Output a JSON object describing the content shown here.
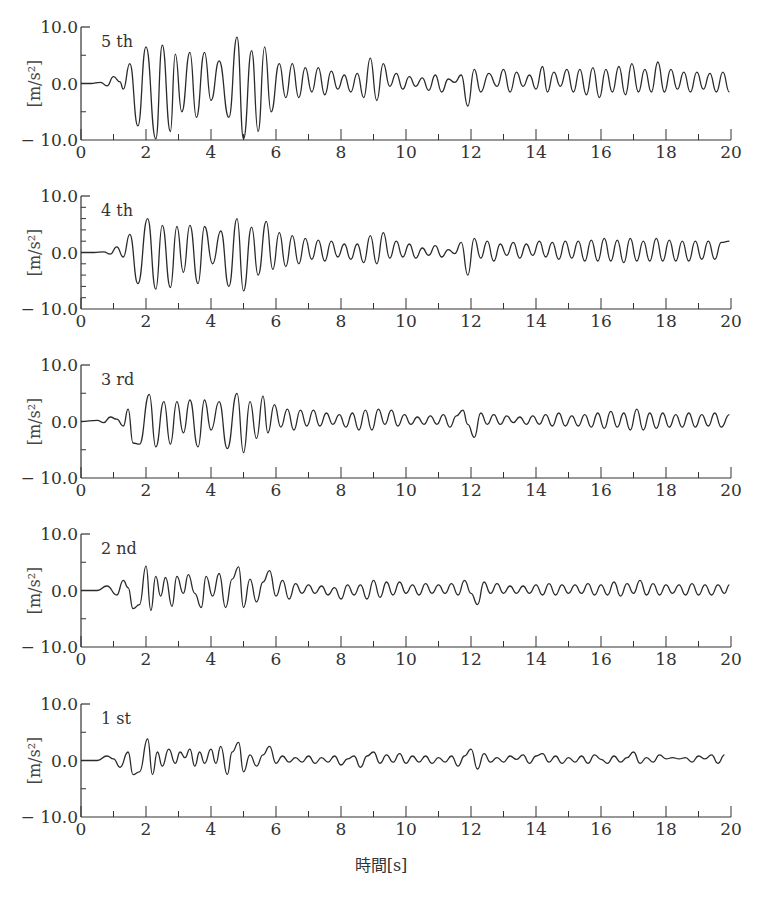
{
  "chart_data": {
    "type": "line",
    "title": "",
    "xlabel": "時間[s]",
    "ylabel": "[m/s²]",
    "xlim": [
      0,
      20
    ],
    "ylim": [
      -10,
      10
    ],
    "x_ticks": [
      0,
      2,
      4,
      6,
      8,
      10,
      12,
      14,
      16,
      18,
      20
    ],
    "x_minor_step": 1,
    "y_tick_labels": [
      "10.0",
      "0.0",
      "-10.0"
    ],
    "grid": false,
    "legend": "none",
    "panels": [
      {
        "label": "5 th",
        "y_minor_step": 5,
        "series": {
          "name": "5 th",
          "x": [
            0,
            0.3,
            0.6,
            0.8,
            1.0,
            1.2,
            1.3,
            1.5,
            1.75,
            2.0,
            2.3,
            2.5,
            2.75,
            2.9,
            3.1,
            3.35,
            3.55,
            3.8,
            4.0,
            4.25,
            4.55,
            4.8,
            5.0,
            5.25,
            5.45,
            5.65,
            5.85,
            6.1,
            6.3,
            6.5,
            6.7,
            6.9,
            7.1,
            7.3,
            7.5,
            7.7,
            7.9,
            8.1,
            8.3,
            8.5,
            8.7,
            8.9,
            9.1,
            9.3,
            9.5,
            9.7,
            9.9,
            10.1,
            10.3,
            10.5,
            10.7,
            10.9,
            11.1,
            11.3,
            11.5,
            11.7,
            11.9,
            12.1,
            12.3,
            12.55,
            12.8,
            13.0,
            13.2,
            13.4,
            13.6,
            13.8,
            14.0,
            14.2,
            14.35,
            14.55,
            14.75,
            14.95,
            15.15,
            15.35,
            15.55,
            15.75,
            15.95,
            16.15,
            16.35,
            16.55,
            16.75,
            16.95,
            17.15,
            17.35,
            17.55,
            17.75,
            17.95,
            18.15,
            18.35,
            18.55,
            18.75,
            18.95,
            19.15,
            19.35,
            19.55,
            19.75,
            19.95
          ],
          "y": [
            0,
            0,
            0.2,
            -0.4,
            1.2,
            0.3,
            -1.0,
            3.5,
            -7.5,
            6.5,
            -9.8,
            6.8,
            -8.5,
            5.2,
            -5.0,
            5.5,
            -6.0,
            5.5,
            -3.0,
            4.0,
            -6.0,
            8.2,
            -9.8,
            5.8,
            -8.5,
            6.5,
            -5.0,
            3.5,
            -2.5,
            3.5,
            -2.5,
            2.8,
            -1.5,
            2.8,
            -2.0,
            2.2,
            -1.0,
            1.5,
            -1.5,
            1.8,
            -2.5,
            4.5,
            -3.0,
            3.5,
            -0.5,
            1.8,
            -1.0,
            1.2,
            -0.5,
            1.0,
            -1.2,
            1.5,
            -1.5,
            0.8,
            0.2,
            1.5,
            -4.0,
            2.5,
            -1.5,
            1.8,
            -0.5,
            2.5,
            -1.5,
            2.0,
            -0.5,
            1.5,
            -1.0,
            3.0,
            -1.5,
            2.0,
            -0.5,
            2.5,
            -1.5,
            2.5,
            -2.0,
            2.8,
            -2.5,
            2.5,
            -1.5,
            3.0,
            -2.0,
            3.5,
            -1.5,
            2.5,
            -1.5,
            3.8,
            -1.5,
            2.5,
            -1.0,
            2.0,
            -1.5,
            2.0,
            -1.0,
            1.8,
            -1.5,
            2.0,
            -1.5,
            2.2
          ]
        }
      },
      {
        "label": "4 th",
        "y_minor_step": 2,
        "series": {
          "name": "4 th",
          "x": [
            0,
            0.4,
            0.7,
            0.9,
            1.1,
            1.3,
            1.5,
            1.75,
            2.05,
            2.3,
            2.5,
            2.75,
            2.95,
            3.15,
            3.35,
            3.6,
            3.8,
            4.05,
            4.3,
            4.55,
            4.8,
            5.0,
            5.25,
            5.45,
            5.7,
            5.9,
            6.1,
            6.3,
            6.5,
            6.7,
            6.9,
            7.1,
            7.3,
            7.5,
            7.7,
            7.9,
            8.1,
            8.3,
            8.5,
            8.7,
            8.9,
            9.1,
            9.3,
            9.5,
            9.7,
            9.9,
            10.1,
            10.3,
            10.5,
            10.7,
            10.9,
            11.1,
            11.3,
            11.5,
            11.7,
            11.9,
            12.1,
            12.3,
            12.5,
            12.7,
            12.9,
            13.1,
            13.3,
            13.5,
            13.7,
            13.9,
            14.1,
            14.3,
            14.5,
            14.7,
            14.9,
            15.1,
            15.3,
            15.5,
            15.7,
            15.9,
            16.1,
            16.3,
            16.5,
            16.7,
            16.9,
            17.1,
            17.3,
            17.5,
            17.7,
            17.9,
            18.1,
            18.3,
            18.5,
            18.7,
            18.9,
            19.1,
            19.3,
            19.5,
            19.7,
            19.95
          ],
          "y": [
            0,
            0,
            0.1,
            -0.3,
            1.0,
            -0.8,
            3.2,
            -5.5,
            6.0,
            -6.5,
            4.8,
            -6.2,
            4.6,
            -3.5,
            4.8,
            -5.5,
            4.6,
            -2.0,
            3.8,
            -6.0,
            6.0,
            -6.8,
            4.5,
            -4.0,
            5.5,
            -3.0,
            3.5,
            -2.5,
            3.0,
            -2.0,
            2.5,
            -1.2,
            2.2,
            -1.5,
            2.0,
            -0.8,
            1.5,
            -1.2,
            1.5,
            -1.8,
            3.0,
            -2.0,
            3.5,
            -1.0,
            2.0,
            -0.8,
            1.5,
            -1.0,
            0.8,
            -0.5,
            1.2,
            -0.8,
            0.5,
            -0.2,
            1.8,
            -4.0,
            2.5,
            -1.0,
            2.0,
            -1.5,
            1.5,
            -0.5,
            1.8,
            -1.0,
            1.5,
            -0.5,
            2.0,
            -0.8,
            1.8,
            -1.2,
            2.0,
            -1.0,
            2.0,
            -1.5,
            2.2,
            -1.5,
            2.5,
            -1.5,
            2.2,
            -1.8,
            2.5,
            -1.5,
            2.0,
            -1.5,
            2.5,
            -1.5,
            2.2,
            -1.5,
            2.0,
            -1.5,
            2.0,
            -1.2,
            2.0,
            -1.2,
            1.8,
            2.0
          ]
        }
      },
      {
        "label": "3 rd",
        "y_minor_step": 5,
        "series": {
          "name": "3 rd",
          "x": [
            0,
            0.5,
            0.7,
            0.9,
            1.1,
            1.3,
            1.45,
            1.6,
            1.8,
            2.1,
            2.3,
            2.55,
            2.75,
            2.95,
            3.15,
            3.35,
            3.6,
            3.8,
            4.0,
            4.25,
            4.5,
            4.8,
            5.0,
            5.2,
            5.4,
            5.6,
            5.75,
            5.95,
            6.15,
            6.35,
            6.55,
            6.75,
            6.95,
            7.15,
            7.35,
            7.55,
            7.75,
            7.95,
            8.15,
            8.35,
            8.55,
            8.75,
            8.95,
            9.15,
            9.35,
            9.55,
            9.75,
            9.95,
            10.15,
            10.35,
            10.55,
            10.75,
            10.95,
            11.15,
            11.35,
            11.55,
            11.75,
            11.9,
            12.1,
            12.3,
            12.5,
            12.7,
            12.9,
            13.1,
            13.3,
            13.5,
            13.7,
            13.9,
            14.1,
            14.3,
            14.5,
            14.7,
            14.9,
            15.1,
            15.3,
            15.5,
            15.7,
            15.9,
            16.1,
            16.3,
            16.5,
            16.7,
            16.9,
            17.1,
            17.3,
            17.5,
            17.7,
            17.9,
            18.1,
            18.3,
            18.5,
            18.7,
            18.9,
            19.1,
            19.3,
            19.5,
            19.7,
            19.95
          ],
          "y": [
            0,
            0.2,
            -0.2,
            0.8,
            0.4,
            -0.8,
            2.2,
            -3.8,
            -4.0,
            4.8,
            -4.5,
            3.5,
            -4.0,
            3.5,
            -2.0,
            3.8,
            -4.5,
            3.8,
            -1.5,
            3.5,
            -4.8,
            5.0,
            -5.5,
            3.5,
            -3.0,
            4.5,
            -2.0,
            3.0,
            -1.0,
            2.2,
            -1.5,
            2.0,
            -0.8,
            2.0,
            -0.8,
            1.5,
            -0.5,
            1.2,
            -1.0,
            1.5,
            -1.5,
            2.0,
            -1.5,
            2.2,
            -0.5,
            2.0,
            -0.8,
            1.2,
            -0.5,
            0.8,
            -0.5,
            1.0,
            -0.5,
            1.2,
            -1.0,
            1.0,
            2.0,
            -0.5,
            -2.8,
            1.5,
            -0.5,
            1.2,
            -0.5,
            1.0,
            -0.2,
            0.8,
            -0.5,
            1.0,
            -0.5,
            1.2,
            -0.8,
            1.5,
            -0.8,
            1.0,
            -0.8,
            1.2,
            -1.0,
            1.5,
            -1.2,
            1.8,
            -1.0,
            1.5,
            -1.5,
            2.2,
            -1.5,
            1.5,
            -1.2,
            1.5,
            -1.0,
            1.2,
            -1.0,
            1.5,
            -1.0,
            1.2,
            -0.8,
            1.5,
            -1.0,
            1.2
          ]
        }
      },
      {
        "label": "2 nd",
        "y_minor_step": 5,
        "series": {
          "name": "2 nd",
          "x": [
            0,
            0.5,
            0.8,
            1.1,
            1.3,
            1.45,
            1.6,
            1.8,
            2.0,
            2.15,
            2.3,
            2.45,
            2.6,
            2.8,
            2.95,
            3.15,
            3.3,
            3.5,
            3.7,
            3.85,
            4.05,
            4.25,
            4.45,
            4.65,
            4.85,
            5.0,
            5.2,
            5.4,
            5.6,
            5.8,
            6.0,
            6.2,
            6.4,
            6.6,
            6.8,
            7.0,
            7.2,
            7.4,
            7.6,
            7.8,
            8.0,
            8.2,
            8.4,
            8.6,
            8.8,
            9.0,
            9.2,
            9.4,
            9.6,
            9.8,
            10.0,
            10.2,
            10.4,
            10.6,
            10.8,
            11.0,
            11.2,
            11.4,
            11.6,
            11.8,
            12.0,
            12.2,
            12.4,
            12.6,
            12.8,
            13.0,
            13.2,
            13.4,
            13.6,
            13.8,
            14.0,
            14.2,
            14.4,
            14.6,
            14.8,
            15.0,
            15.2,
            15.4,
            15.6,
            15.8,
            16.0,
            16.2,
            16.4,
            16.6,
            16.8,
            17.0,
            17.2,
            17.4,
            17.6,
            17.8,
            18.0,
            18.2,
            18.4,
            18.6,
            18.8,
            19.0,
            19.2,
            19.4,
            19.6,
            19.8,
            19.95
          ],
          "y": [
            0,
            0,
            0.8,
            -0.8,
            1.8,
            0.5,
            -3.2,
            -2.5,
            4.3,
            -3.5,
            2.5,
            -1.0,
            2.3,
            -2.8,
            2.5,
            -0.5,
            2.8,
            -0.5,
            -3.0,
            2.5,
            -1.0,
            3.0,
            -3.0,
            2.0,
            4.2,
            -3.0,
            2.0,
            -2.0,
            1.5,
            3.5,
            -1.0,
            1.8,
            -1.5,
            1.2,
            -0.5,
            1.0,
            -0.5,
            0.8,
            -0.8,
            0.5,
            -1.5,
            1.0,
            -0.8,
            1.0,
            -1.5,
            1.8,
            -1.2,
            1.5,
            -0.8,
            1.5,
            -0.5,
            1.0,
            -0.8,
            1.2,
            -0.5,
            1.0,
            -0.5,
            1.2,
            -0.8,
            1.8,
            -0.5,
            -2.5,
            1.5,
            -0.5,
            1.2,
            -0.5,
            0.8,
            -0.5,
            0.8,
            -0.5,
            1.0,
            -0.8,
            1.2,
            -0.8,
            1.0,
            -0.5,
            1.0,
            -0.5,
            1.2,
            -0.8,
            1.0,
            -0.8,
            1.5,
            -1.0,
            1.2,
            -0.5,
            1.8,
            -0.8,
            1.2,
            -0.8,
            1.0,
            -0.5,
            1.0,
            -0.8,
            1.2,
            -0.8,
            1.0,
            -0.8,
            1.0,
            -0.5,
            1.0
          ]
        }
      },
      {
        "label": "1 st",
        "y_minor_step": 5,
        "series": {
          "name": "1 st",
          "x": [
            0,
            0.5,
            0.8,
            1.0,
            1.2,
            1.45,
            1.6,
            1.8,
            2.05,
            2.2,
            2.35,
            2.5,
            2.7,
            2.9,
            3.05,
            3.2,
            3.35,
            3.5,
            3.65,
            3.8,
            4.0,
            4.15,
            4.3,
            4.5,
            4.65,
            4.85,
            5.0,
            5.2,
            5.4,
            5.6,
            5.8,
            6.0,
            6.2,
            6.4,
            6.6,
            6.8,
            7.0,
            7.2,
            7.4,
            7.6,
            7.8,
            8.0,
            8.2,
            8.4,
            8.6,
            8.8,
            9.0,
            9.2,
            9.4,
            9.6,
            9.8,
            10.0,
            10.2,
            10.4,
            10.6,
            10.8,
            11.0,
            11.2,
            11.4,
            11.6,
            11.8,
            12.0,
            12.2,
            12.4,
            12.6,
            12.8,
            13.0,
            13.2,
            13.4,
            13.6,
            13.8,
            14.0,
            14.2,
            14.4,
            14.6,
            14.8,
            15.0,
            15.2,
            15.4,
            15.6,
            15.8,
            16.0,
            16.2,
            16.4,
            16.6,
            16.8,
            17.0,
            17.2,
            17.4,
            17.6,
            17.8,
            18.0,
            18.2,
            18.4,
            18.6,
            18.8,
            19.0,
            19.2,
            19.4,
            19.6,
            19.8,
            19.95
          ],
          "y": [
            0,
            0,
            0.8,
            0.3,
            -1.2,
            1.5,
            -2.5,
            -2.0,
            3.8,
            -2.5,
            1.5,
            -1.0,
            2.0,
            -0.5,
            1.5,
            0.5,
            2.0,
            -1.0,
            1.5,
            -0.5,
            2.0,
            -0.5,
            2.5,
            -2.5,
            1.5,
            3.2,
            -2.0,
            1.0,
            -1.0,
            1.0,
            2.5,
            -0.5,
            0.8,
            -0.3,
            0.5,
            -0.3,
            0.8,
            -0.5,
            0.5,
            -0.3,
            0.8,
            -0.8,
            0.3,
            0.8,
            -1.2,
            0.8,
            1.5,
            -0.5,
            1.0,
            -0.3,
            1.2,
            -0.5,
            0.8,
            -0.3,
            0.8,
            -0.5,
            0.5,
            -0.3,
            0.8,
            -1.0,
            0.8,
            2.0,
            -1.5,
            1.2,
            -0.3,
            0.5,
            -0.3,
            0.8,
            0.2,
            1.0,
            -0.5,
            0.8,
            1.2,
            -0.3,
            0.8,
            -0.5,
            0.5,
            -0.3,
            0.8,
            -0.5,
            1.0,
            0.2,
            -0.5,
            0.8,
            -0.3,
            0.5,
            1.5,
            -0.5,
            0.5,
            -0.3,
            1.0,
            0.3,
            0.5,
            0.3,
            0.5,
            -0.3,
            0.8,
            0.3,
            1.0,
            -0.5,
            1.0
          ]
        }
      }
    ]
  },
  "figure": {
    "xlabel": "時間[s]",
    "ylabel": "[m/s²]"
  }
}
